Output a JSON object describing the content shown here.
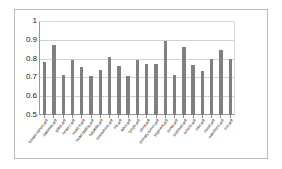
{
  "chart_data": {
    "type": "bar",
    "title": "",
    "subtitle": "",
    "xlabel": "",
    "ylabel": "",
    "ylim": [
      0.5,
      1
    ],
    "ytick_labels": [
      "1",
      "0.9",
      "0.8",
      "0.7",
      "0.6",
      "0.5"
    ],
    "ytick_values": [
      1,
      0.9,
      0.8,
      0.7,
      0.6,
      0.5
    ],
    "grid": true,
    "legend": "none",
    "series_color": "#808080",
    "categories": [
      "breast-cancer.arff",
      "diabetes.arff",
      "glass.arff",
      "heart-c.arff",
      "heart-h.arff",
      "heart-statlog.arff",
      "hepatitis.arff",
      "ionosphere.arff",
      "iris.arff",
      "labor.arff",
      "lymph.arff",
      "pima.arff",
      "primary-tumor.arff",
      "segment.arff",
      "sonar.arff",
      "soybean.arff",
      "vehicle.arff",
      "vote.arff",
      "vowel.arff",
      "waveform.arff",
      "zoo.arff"
    ],
    "values": [
      0.78,
      0.87,
      0.715,
      0.79,
      0.755,
      0.71,
      0.74,
      0.81,
      0.76,
      0.705,
      0.79,
      0.77,
      0.77,
      0.895,
      0.715,
      0.86,
      0.765,
      0.735,
      0.8,
      0.845,
      0.8
    ],
    "bar_count": 21
  }
}
